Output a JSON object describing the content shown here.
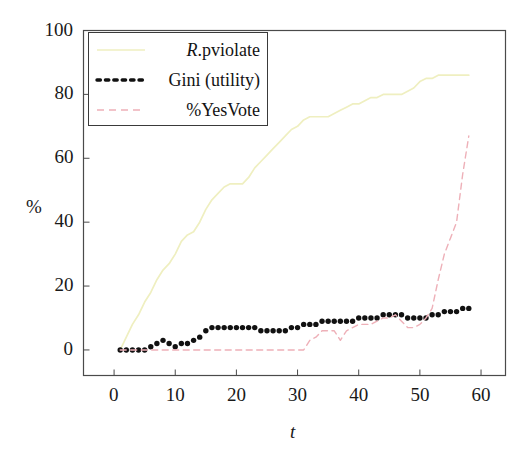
{
  "chart_data": {
    "type": "line",
    "title": "",
    "xlabel": "t",
    "ylabel": "%",
    "xlim": [
      -5,
      64
    ],
    "ylim": [
      -8,
      100
    ],
    "xticks": [
      0,
      10,
      20,
      30,
      40,
      50,
      60
    ],
    "yticks": [
      0,
      20,
      40,
      60,
      80,
      100
    ],
    "xtick_labels": [
      "0",
      "10",
      "20",
      "30",
      "40",
      "50",
      "60"
    ],
    "ytick_labels": [
      "0",
      "20",
      "40",
      "60",
      "80",
      "100"
    ],
    "grid": false,
    "legend_position": "upper-left",
    "series": [
      {
        "name": "R.pviolate",
        "name_italic_prefix": "R",
        "name_rest": ".pviolate",
        "style": "solid",
        "color": "#efefc0",
        "x": [
          1,
          2,
          3,
          4,
          5,
          6,
          7,
          8,
          9,
          10,
          11,
          12,
          13,
          14,
          15,
          16,
          17,
          18,
          19,
          20,
          21,
          22,
          23,
          24,
          25,
          26,
          27,
          28,
          29,
          30,
          31,
          32,
          33,
          34,
          35,
          36,
          37,
          38,
          39,
          40,
          41,
          42,
          43,
          44,
          45,
          46,
          47,
          48,
          49,
          50,
          51,
          52,
          53,
          54,
          55,
          56,
          57,
          58
        ],
        "values": [
          0,
          4,
          8,
          11,
          15,
          18,
          22,
          25,
          27,
          30,
          34,
          36,
          37,
          40,
          44,
          47,
          49,
          51,
          52,
          52,
          52,
          54,
          57,
          59,
          61,
          63,
          65,
          67,
          69,
          70,
          72,
          73,
          73,
          73,
          73,
          74,
          75,
          76,
          77,
          77,
          78,
          79,
          79,
          80,
          80,
          80,
          80,
          81,
          82,
          84,
          85,
          85,
          86,
          86,
          86,
          86,
          86,
          86
        ]
      },
      {
        "name": "Gini (utility)",
        "style": "dotted",
        "color": "#111111",
        "x": [
          1,
          2,
          3,
          4,
          5,
          6,
          7,
          8,
          9,
          10,
          11,
          12,
          13,
          14,
          15,
          16,
          17,
          18,
          19,
          20,
          21,
          22,
          23,
          24,
          25,
          26,
          27,
          28,
          29,
          30,
          31,
          32,
          33,
          34,
          35,
          36,
          37,
          38,
          39,
          40,
          41,
          42,
          43,
          44,
          45,
          46,
          47,
          48,
          49,
          50,
          51,
          52,
          53,
          54,
          55,
          56,
          57,
          58
        ],
        "values": [
          0,
          0,
          0,
          0,
          0,
          1,
          2,
          3,
          2,
          1,
          2,
          2,
          3,
          4,
          6,
          7,
          7,
          7,
          7,
          7,
          7,
          7,
          7,
          6,
          6,
          6,
          6,
          6,
          7,
          7,
          8,
          8,
          8,
          9,
          9,
          9,
          9,
          9,
          9,
          10,
          10,
          10,
          10,
          11,
          11,
          11,
          11,
          10,
          10,
          10,
          10,
          11,
          11,
          12,
          12,
          12,
          13,
          13
        ]
      },
      {
        "name": "%YesVote",
        "style": "dashed",
        "color": "#eeb0b8",
        "x": [
          1,
          2,
          3,
          4,
          5,
          6,
          7,
          8,
          9,
          10,
          11,
          12,
          13,
          14,
          15,
          16,
          17,
          18,
          19,
          20,
          21,
          22,
          23,
          24,
          25,
          26,
          27,
          28,
          29,
          30,
          31,
          32,
          33,
          34,
          35,
          36,
          37,
          38,
          39,
          40,
          41,
          42,
          43,
          44,
          45,
          46,
          47,
          48,
          49,
          50,
          51,
          52,
          53,
          54,
          55,
          56,
          57,
          58
        ],
        "values": [
          0,
          0,
          0,
          0,
          0,
          0,
          0,
          0,
          0,
          0,
          0,
          0,
          0,
          0,
          0,
          0,
          0,
          0,
          0,
          0,
          0,
          0,
          0,
          0,
          0,
          0,
          0,
          0,
          0,
          0,
          0,
          3,
          4,
          6,
          6,
          6,
          3,
          6,
          7,
          8,
          8,
          8,
          9,
          10,
          10,
          11,
          9,
          7,
          7,
          8,
          10,
          13,
          22,
          30,
          35,
          40,
          55,
          67
        ]
      }
    ]
  },
  "axes": {
    "y_label": "%",
    "x_label": "t"
  },
  "legend": {
    "entries": [
      {
        "label": "R.pviolate",
        "italic_prefix": "R",
        "rest": ".pviolate",
        "sample": "solid-line-sample",
        "color": "#efefc0"
      },
      {
        "label": "Gini (utility)",
        "italic_prefix": "",
        "rest": "Gini (utility)",
        "sample": "dotted-line-sample",
        "color": "#111111"
      },
      {
        "label": "%YesVote",
        "italic_prefix": "",
        "rest": "%YesVote",
        "sample": "dashed-line-sample",
        "color": "#eeb0b8"
      }
    ]
  }
}
